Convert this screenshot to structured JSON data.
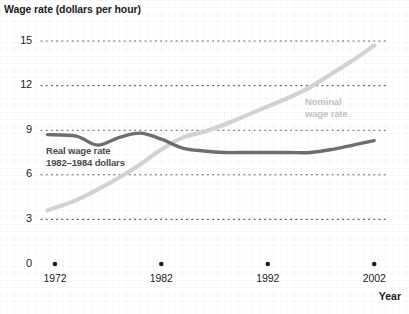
{
  "chart_data": {
    "type": "line",
    "title": "Wage rate (dollars per hour)",
    "xlabel": "Year",
    "ylabel": "Wage rate (dollars per hour)",
    "xlim": [
      1970,
      2003
    ],
    "ylim": [
      0,
      16.5
    ],
    "yticks": [
      15,
      12,
      9,
      6,
      3,
      0
    ],
    "ytick_labels": [
      "15",
      "12",
      "9",
      "6",
      "3",
      "0"
    ],
    "xticks": [
      1972,
      1982,
      1992,
      2002
    ],
    "xtick_labels": [
      "1972",
      "1982",
      "1992",
      "2002"
    ],
    "grid": "horizontal-dotted",
    "legend_position": "inline-annotations",
    "series": [
      {
        "name": "Nominal wage rate",
        "annotation": "Nominal\nwage rate",
        "annotation_line1": "Nominal",
        "annotation_line2": "wage rate",
        "color": "#d2d2d2",
        "x": [
          1971.3,
          1974,
          1976,
          1978,
          1980,
          1982,
          1984,
          1986,
          1988,
          1990,
          1992,
          1994,
          1996,
          1998,
          2000,
          2002
        ],
        "values": [
          3.6,
          4.3,
          5.0,
          5.8,
          6.7,
          7.7,
          8.5,
          8.9,
          9.4,
          10.0,
          10.6,
          11.2,
          11.9,
          12.8,
          13.7,
          14.7
        ]
      },
      {
        "name": "Real wage rate",
        "annotation": "Real wage rate\n1982–1984 dollars",
        "annotation_line1": "Real wage rate",
        "annotation_line2": "1982–1984 dollars",
        "color": "#6e6e6e",
        "x": [
          1971.3,
          1974,
          1976,
          1978,
          1980,
          1982,
          1984,
          1986,
          1988,
          1990,
          1992,
          1994,
          1996,
          1998,
          2000,
          2002
        ],
        "values": [
          8.7,
          8.6,
          8.0,
          8.5,
          8.8,
          8.4,
          7.8,
          7.6,
          7.5,
          7.5,
          7.5,
          7.5,
          7.5,
          7.7,
          8.0,
          8.3
        ]
      }
    ]
  },
  "axes": {
    "y_labels": [
      "15",
      "12",
      "9",
      "6",
      "3",
      "0"
    ],
    "x_labels": [
      "1972",
      "1982",
      "1992",
      "2002"
    ],
    "x_title": "Year"
  },
  "title": "Wage rate (dollars per hour)",
  "annotations": {
    "real": {
      "line1": "Real wage rate",
      "line2": "1982–1984 dollars"
    },
    "nominal": {
      "line1": "Nominal",
      "line2": "wage rate"
    }
  },
  "colors": {
    "nominal": "#d2d2d2",
    "real": "#6e6e6e",
    "grid": "#5a5a5a",
    "text": "#232323"
  }
}
